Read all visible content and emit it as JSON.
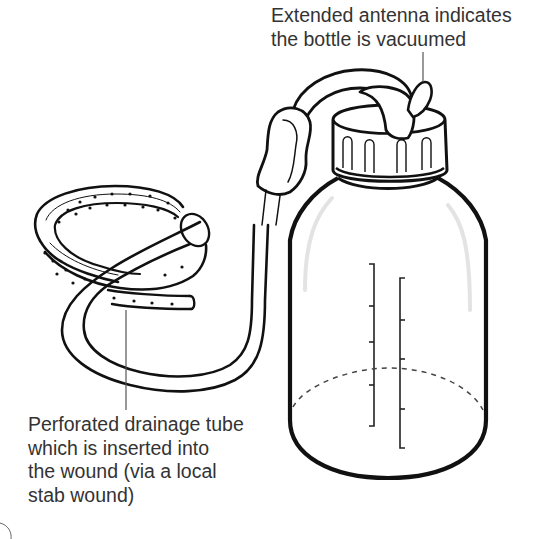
{
  "diagram": {
    "labels": {
      "antenna": "Extended antenna indicates\nthe bottle is vacuumed",
      "tube": "Perforated drainage tube\nwhich is inserted into\nthe wound (via a local\nstab wound)"
    },
    "parts": [
      {
        "id": "bottle",
        "name": "Vacuum drainage bottle"
      },
      {
        "id": "cap",
        "name": "Ribbed screw cap"
      },
      {
        "id": "antenna",
        "name": "Vacuum indicator antenna"
      },
      {
        "id": "connector-tube",
        "name": "Connecting tube"
      },
      {
        "id": "clamp",
        "name": "Tube clamp"
      },
      {
        "id": "drain-coil",
        "name": "Perforated drainage tube coil"
      },
      {
        "id": "scale-left",
        "name": "Graduation scale (left)",
        "ticks": 5
      },
      {
        "id": "scale-right",
        "name": "Graduation scale (right)",
        "ticks": 5
      },
      {
        "id": "fluid-level",
        "name": "Dashed fluid level line"
      }
    ],
    "colors": {
      "line": "#111111",
      "text": "#333333",
      "leader": "#555555",
      "dash": "#444444",
      "highlight": "#e6e6e6"
    }
  }
}
